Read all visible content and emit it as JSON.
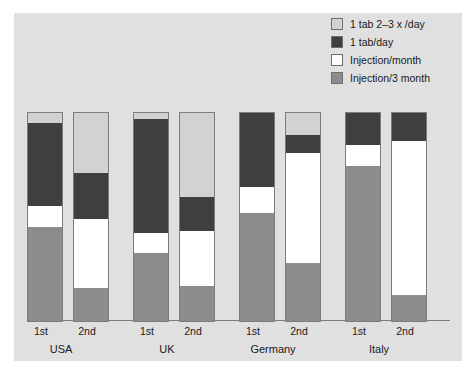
{
  "chart_data": {
    "type": "bar",
    "subtype": "stacked-bar-100pct",
    "title": "",
    "xlabel": "",
    "ylabel": "",
    "ylim": [
      0,
      100
    ],
    "grid": false,
    "legend_position": "top-right",
    "categories": [
      "USA 1st",
      "USA 2nd",
      "UK 1st",
      "UK 2nd",
      "Germany 1st",
      "Germany 2nd",
      "Italy 1st",
      "Italy 2nd"
    ],
    "groups": [
      "USA",
      "UK",
      "Germany",
      "Italy"
    ],
    "subcategories": [
      "1st",
      "2nd"
    ],
    "series": [
      {
        "name": "1 tab 2–3 x /day",
        "color": "#d2d2d2",
        "values": [
          4.8,
          28.8,
          2.9,
          40.4,
          0.0,
          10.6,
          0.0,
          0.0
        ]
      },
      {
        "name": "1 tab/day",
        "color": "#3f3f3f",
        "values": [
          39.9,
          22.1,
          54.8,
          16.3,
          35.6,
          8.7,
          15.4,
          13.5
        ]
      },
      {
        "name": "Injection/month",
        "color": "#ffffff",
        "values": [
          10.1,
          33.2,
          9.6,
          26.4,
          12.5,
          52.9,
          10.1,
          73.9
        ]
      },
      {
        "name": "Injection/3 month",
        "color": "#8c8c8c",
        "values": [
          45.2,
          15.9,
          32.7,
          16.9,
          51.9,
          27.8,
          74.5,
          12.6
        ]
      }
    ]
  },
  "legend": {
    "items": [
      {
        "label": "1 tab 2–3 x /day",
        "color": "#d2d2d2"
      },
      {
        "label": "1 tab/day",
        "color": "#3f3f3f"
      },
      {
        "label": "Injection/month",
        "color": "#ffffff"
      },
      {
        "label": "Injection/3 month",
        "color": "#8c8c8c"
      }
    ]
  },
  "axis": {
    "tick_labels": [
      "1st",
      "2nd",
      "1st",
      "2nd",
      "1st",
      "2nd",
      "1st",
      "2nd"
    ],
    "group_labels": [
      "USA",
      "UK",
      "Germany",
      "Italy"
    ]
  },
  "colors": {
    "panel_background": "#e0e0e0",
    "page_background": "#ffffff",
    "outline": "#7d7d7d",
    "text": "#1a1a1a"
  }
}
